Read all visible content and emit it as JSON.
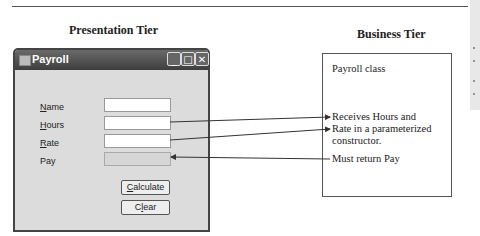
{
  "presentation_tier": {
    "title": "Presentation Tier",
    "window": {
      "title": "Payroll",
      "controls": [
        "minimize",
        "maximize",
        "close"
      ],
      "fields": [
        {
          "label": "Name",
          "access_key": "N",
          "rest": "ame",
          "value": "",
          "readonly": false
        },
        {
          "label": "Hours",
          "access_key": "H",
          "rest": "ours",
          "value": "",
          "readonly": false
        },
        {
          "label": "Rate",
          "access_key": "R",
          "rest": "ate",
          "value": "",
          "readonly": false
        },
        {
          "label": "Pay",
          "access_key": "",
          "rest": "Pay",
          "value": "",
          "readonly": true
        }
      ],
      "buttons": [
        {
          "label": "Calculate",
          "access_key": "C",
          "rest": "alculate"
        },
        {
          "label": "Clear",
          "access_key": "",
          "rest": "Clear",
          "pre": "C",
          "key": "l",
          "post": "ear"
        }
      ]
    }
  },
  "business_tier": {
    "title": "Business Tier",
    "class_name": "Payroll class",
    "note_receives": [
      "Receives Hours and",
      "Rate in a parameterized",
      "constructor."
    ],
    "note_returns": "Must return Pay"
  }
}
